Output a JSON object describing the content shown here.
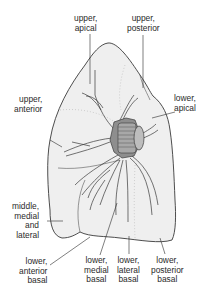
{
  "diagram": {
    "colors": {
      "lung_fill": "#efefef",
      "outline": "#3a3a3a",
      "hilum": "#9a9a9a",
      "hilum_dark": "#6e6e6e",
      "text": "#2a2a2a"
    },
    "labels": {
      "upper_apical": "upper,\napical",
      "upper_posterior": "upper,\nposterior",
      "upper_anterior": "upper,\nanterior",
      "lower_apical": "lower,\napical",
      "middle_medial_lateral": "middle,\nmedial\nand\nlateral",
      "lower_anterior_basal": "lower,\nanterior\nbasal",
      "lower_medial_basal": "lower,\nmedial\nbasal",
      "lower_lateral_basal": "lower,\nlateral\nbasal",
      "lower_posterior_basal": "lower,\nposterior\nbasal"
    }
  }
}
